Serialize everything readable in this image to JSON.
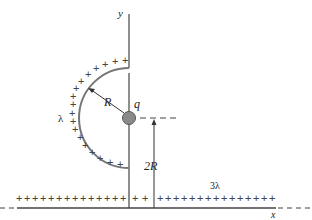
{
  "diagram": {
    "labels": {
      "y_axis": "y",
      "x_axis": "x",
      "radius": "R",
      "charge": "q",
      "height": "2R",
      "arc_density": "λ",
      "line_density": "3λ"
    },
    "colors": {
      "line": "#555555",
      "charge_fill": "#8a8a8a",
      "arc": "#777777"
    },
    "charge_symbol": "+"
  }
}
